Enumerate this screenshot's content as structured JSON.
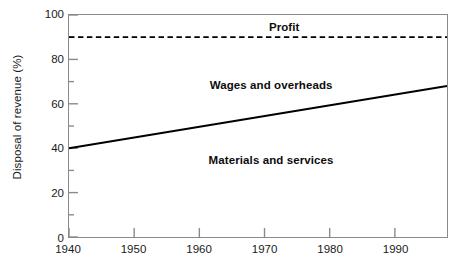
{
  "chart_data": {
    "type": "line",
    "title": "",
    "xlabel": "",
    "ylabel": "Disposal of revenue (%)",
    "xlim": [
      1940,
      1998
    ],
    "ylim": [
      0,
      100
    ],
    "grid": false,
    "legend_position": "none",
    "background_color": "#ffffff",
    "frame_color": "#8a8a8a",
    "series": [
      {
        "name": "Materials and services boundary",
        "style": "solid",
        "color": "#000000",
        "x": [
          1940,
          1998
        ],
        "values": [
          40,
          68
        ]
      },
      {
        "name": "Profit boundary",
        "style": "dashed",
        "color": "#000000",
        "x": [
          1940,
          1998
        ],
        "values": [
          90,
          90
        ]
      }
    ],
    "yticks_major": [
      0,
      20,
      40,
      60,
      80,
      100
    ],
    "yticks_major_labels": [
      "0",
      "20",
      "40",
      "60",
      "80",
      "100"
    ],
    "yticks_minor": [
      10,
      30,
      50,
      70,
      90
    ],
    "xticks_major": [
      1940,
      1950,
      1960,
      1970,
      1980,
      1990
    ],
    "xticks_major_labels": [
      "1940",
      "1950",
      "1960",
      "1970",
      "1980",
      "1990"
    ],
    "annotations": [
      {
        "text": "Profit",
        "x": 1973,
        "y": 94
      },
      {
        "text": "Wages and overheads",
        "x": 1971,
        "y": 68.5
      },
      {
        "text": "Materials and services",
        "x": 1971,
        "y": 35
      }
    ]
  }
}
